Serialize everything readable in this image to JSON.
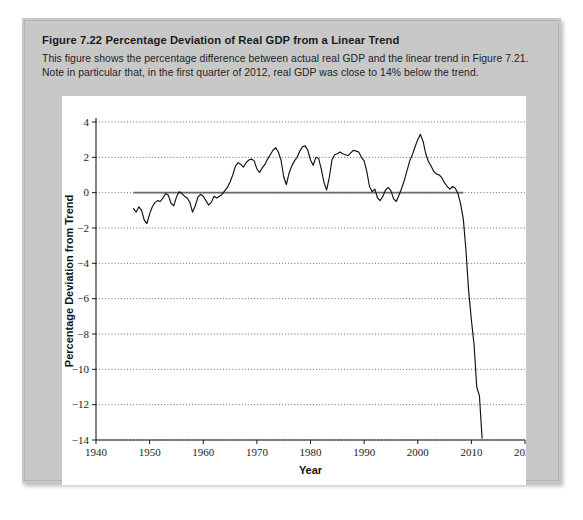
{
  "caption": {
    "figure_label": "Figure 7.22",
    "figure_title": "Percentage Deviation of Real GDP from a Linear Trend",
    "description": "This figure shows the percentage difference between actual real GDP and the linear trend in Figure 7.21. Note in particular that, in the first quarter of 2012, real GDP was close to 14% below the trend."
  },
  "chart_data": {
    "type": "line",
    "title": "Percentage Deviation of Real GDP from a Linear Trend",
    "xlabel": "Year",
    "ylabel": "Percentage Deviation from Trend",
    "xlim": [
      1940,
      2020
    ],
    "ylim": [
      -14,
      4
    ],
    "xticks": [
      1940,
      1950,
      1960,
      1970,
      1980,
      1990,
      2000,
      2010,
      2020
    ],
    "yticks": [
      4,
      2,
      0,
      -2,
      -4,
      -6,
      -8,
      -10,
      -12,
      -14
    ],
    "grid": true,
    "grid_style": "dotted-horizontal",
    "legend": null,
    "reference_lines": [
      {
        "name": "zero-trend-line",
        "y": 0,
        "x_from": 1947,
        "x_to": 2008.5,
        "color": "#6a6a6a"
      }
    ],
    "series": [
      {
        "name": "Percentage deviation of real GDP from linear trend",
        "color": "#111111",
        "x": [
          1947.0,
          1947.5,
          1948.0,
          1948.5,
          1949.0,
          1949.5,
          1950.0,
          1950.5,
          1951.0,
          1951.5,
          1952.0,
          1952.5,
          1953.0,
          1953.5,
          1954.0,
          1954.5,
          1955.0,
          1955.5,
          1956.0,
          1956.5,
          1957.0,
          1957.5,
          1958.0,
          1958.5,
          1959.0,
          1959.5,
          1960.0,
          1960.5,
          1961.0,
          1961.5,
          1962.0,
          1962.5,
          1963.0,
          1963.5,
          1964.0,
          1964.5,
          1965.0,
          1965.5,
          1966.0,
          1966.5,
          1967.0,
          1967.5,
          1968.0,
          1968.5,
          1969.0,
          1969.5,
          1970.0,
          1970.5,
          1971.0,
          1971.5,
          1972.0,
          1972.5,
          1973.0,
          1973.5,
          1974.0,
          1974.5,
          1975.0,
          1975.5,
          1976.0,
          1976.5,
          1977.0,
          1977.5,
          1978.0,
          1978.5,
          1979.0,
          1979.5,
          1980.0,
          1980.5,
          1981.0,
          1981.5,
          1982.0,
          1982.5,
          1983.0,
          1983.5,
          1984.0,
          1984.5,
          1985.0,
          1985.5,
          1986.0,
          1986.5,
          1987.0,
          1987.5,
          1988.0,
          1988.5,
          1989.0,
          1989.5,
          1990.0,
          1990.5,
          1991.0,
          1991.5,
          1992.0,
          1992.5,
          1993.0,
          1993.5,
          1994.0,
          1994.5,
          1995.0,
          1995.5,
          1996.0,
          1996.5,
          1997.0,
          1997.5,
          1998.0,
          1998.5,
          1999.0,
          1999.5,
          2000.0,
          2000.5,
          2001.0,
          2001.5,
          2002.0,
          2002.5,
          2003.0,
          2003.5,
          2004.0,
          2004.5,
          2005.0,
          2005.5,
          2006.0,
          2006.5,
          2007.0,
          2007.5,
          2008.0,
          2008.5,
          2009.0,
          2009.5,
          2010.0,
          2010.5,
          2011.0,
          2011.5,
          2012.0
        ],
        "y": [
          -0.9,
          -1.1,
          -0.8,
          -1.0,
          -1.55,
          -1.75,
          -1.2,
          -0.8,
          -0.55,
          -0.45,
          -0.5,
          -0.3,
          -0.05,
          -0.15,
          -0.6,
          -0.75,
          -0.25,
          0.05,
          -0.05,
          -0.2,
          -0.3,
          -0.55,
          -1.1,
          -0.75,
          -0.25,
          -0.1,
          -0.2,
          -0.45,
          -0.7,
          -0.55,
          -0.2,
          -0.3,
          -0.2,
          -0.1,
          0.1,
          0.3,
          0.6,
          1.0,
          1.5,
          1.7,
          1.6,
          1.45,
          1.7,
          1.85,
          1.9,
          1.8,
          1.35,
          1.15,
          1.4,
          1.6,
          1.9,
          2.15,
          2.4,
          2.55,
          2.3,
          1.85,
          0.9,
          0.45,
          1.1,
          1.5,
          1.8,
          2.0,
          2.35,
          2.6,
          2.65,
          2.4,
          1.85,
          1.55,
          2.0,
          1.95,
          1.35,
          0.6,
          0.15,
          0.85,
          1.85,
          2.15,
          2.2,
          2.3,
          2.2,
          2.15,
          2.1,
          2.25,
          2.4,
          2.35,
          2.3,
          2.0,
          1.8,
          1.2,
          0.35,
          0.05,
          0.2,
          -0.3,
          -0.45,
          -0.2,
          0.15,
          0.3,
          0.1,
          -0.35,
          -0.5,
          -0.15,
          0.25,
          0.7,
          1.25,
          1.8,
          2.15,
          2.6,
          3.0,
          3.3,
          2.9,
          2.2,
          1.75,
          1.5,
          1.2,
          1.05,
          1.0,
          0.85,
          0.55,
          0.35,
          0.2,
          0.35,
          0.25,
          -0.05,
          -0.65,
          -1.5,
          -3.3,
          -5.6,
          -7.2,
          -8.6,
          -11.0,
          -11.5,
          -13.9
        ]
      }
    ]
  }
}
